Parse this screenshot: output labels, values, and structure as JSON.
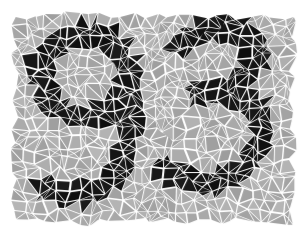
{
  "image": {
    "kind": "mosaic-captcha",
    "title": "Mosaic digit image",
    "alt_text": "93",
    "width": 305,
    "height": 235,
    "background_color": "#ffffff"
  },
  "mosaic": {
    "style": "voronoi-shard-tiles",
    "mortar_color": "#ffffff",
    "mortar_width_px": 2.1,
    "tile_fill_background": "#a9a9a9",
    "tile_fill_foreground": "#151515",
    "tile_fill_background_variation": 26,
    "tile_fill_foreground_variation": 14,
    "tile_shrink_ratio": 0.8,
    "panel": {
      "x": 15,
      "y": 15,
      "width": 278,
      "height": 207
    },
    "seed": 20250931,
    "cell_columns": 26,
    "cell_rows": 20,
    "jitter": 0.46,
    "subdivide_probability": 0.55
  },
  "content": {
    "digits": "93",
    "digit_list": [
      {
        "value": "9",
        "position": "left"
      },
      {
        "value": "3",
        "position": "right"
      }
    ],
    "stroke_width": 25,
    "glyphs": [
      {
        "name": "digit-nine",
        "label": "9",
        "strokes": [
          {
            "type": "ellipse",
            "cx": 86,
            "cy": 75,
            "rx": 44,
            "ry": 42
          },
          {
            "type": "path",
            "points": [
              [
                130,
                72
              ],
              [
                131,
                110
              ],
              [
                128,
                146
              ],
              [
                118,
                174
              ],
              [
                100,
                190
              ],
              [
                76,
                196
              ],
              [
                55,
                193
              ],
              [
                44,
                188
              ]
            ]
          }
        ]
      },
      {
        "name": "digit-three",
        "label": "3",
        "strokes": [
          {
            "type": "path",
            "points": [
              [
                182,
                46
              ],
              [
                198,
                32
              ],
              [
                222,
                27
              ],
              [
                246,
                33
              ],
              [
                257,
                50
              ],
              [
                254,
                70
              ],
              [
                240,
                84
              ],
              [
                218,
                91
              ],
              [
                200,
                92
              ]
            ]
          },
          {
            "type": "path",
            "points": [
              [
                206,
                92
              ],
              [
                232,
                92
              ],
              [
                252,
                101
              ],
              [
                263,
                120
              ],
              [
                261,
                146
              ],
              [
                248,
                167
              ],
              [
                225,
                180
              ],
              [
                198,
                183
              ],
              [
                177,
                176
              ],
              [
                166,
                168
              ]
            ]
          }
        ]
      }
    ]
  },
  "accessibility": {
    "role": "img",
    "description": "Two digits rendered as dark mosaic tiles among gray mosaic tiles"
  }
}
